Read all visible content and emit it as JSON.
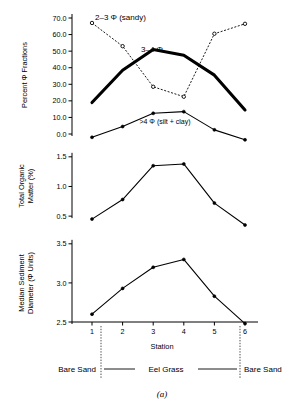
{
  "figure": {
    "caption": "(a)",
    "xaxis_label": "Station",
    "stations": [
      "1",
      "2",
      "3",
      "4",
      "5",
      "6"
    ]
  },
  "zones": {
    "left_label": "Bare Sand",
    "middle_label": "Eel Grass",
    "right_label": "Bare Sand"
  },
  "panels": {
    "top": {
      "ylabel": "Percent Φ Fractions",
      "ticklabels": [
        "0.0",
        "10.0",
        "20.0",
        "30.0",
        "40.0",
        "50.0",
        "60.0",
        "70.0"
      ],
      "series_labels": {
        "sandy": "2–3 Φ (sandy)",
        "mid": "3–4 Φ",
        "fine": ">4 Φ (silt + clay)"
      }
    },
    "middle": {
      "ylabel_line1": "Total Organic",
      "ylabel_line2": "Matter (%)",
      "ticklabels": [
        "0.5",
        "1.0",
        "1.5"
      ]
    },
    "bottom": {
      "ylabel_line1": "Median Sediment",
      "ylabel_line2": "Diameter (Φ Units)",
      "ticklabels": [
        "2.5",
        "3.0",
        "3.5"
      ]
    }
  },
  "chart_data": [
    {
      "type": "line",
      "panel": "top",
      "title": "Percent Phi Fractions by Station",
      "xlabel": "Station",
      "ylabel": "Percent Φ Fractions",
      "x": [
        1,
        2,
        3,
        4,
        5,
        6
      ],
      "ylim": [
        0.0,
        70.0
      ],
      "yticks": [
        0.0,
        10.0,
        20.0,
        30.0,
        40.0,
        50.0,
        60.0,
        70.0
      ],
      "grid": false,
      "legend": "inline-annotations",
      "series": [
        {
          "name": "2–3 Φ (sandy)",
          "style": "dotted-open-markers",
          "values": [
            67.0,
            53.0,
            28.5,
            22.5,
            60.5,
            66.5
          ]
        },
        {
          "name": "3–4 Φ",
          "style": "thick-solid",
          "values": [
            19.0,
            38.5,
            51.0,
            47.5,
            35.5,
            14.5
          ]
        },
        {
          "name": ">4 Φ (silt + clay)",
          "style": "thin-solid-filled-markers",
          "values": [
            -2.0,
            4.5,
            12.5,
            13.5,
            2.5,
            -3.5
          ]
        }
      ]
    },
    {
      "type": "line",
      "panel": "middle",
      "title": "Total Organic Matter by Station",
      "xlabel": "Station",
      "ylabel": "Total Organic Matter (%)",
      "x": [
        1,
        2,
        3,
        4,
        5,
        6
      ],
      "ylim": [
        0.3,
        1.75
      ],
      "yticks": [
        0.5,
        1.0,
        1.5
      ],
      "grid": false,
      "series": [
        {
          "name": "Total Organic Matter",
          "style": "thin-solid-filled-markers",
          "values": [
            0.45,
            0.78,
            1.35,
            1.38,
            0.72,
            0.35
          ]
        }
      ]
    },
    {
      "type": "line",
      "panel": "bottom",
      "title": "Median Sediment Diameter by Station",
      "xlabel": "Station",
      "ylabel": "Median Sediment Diameter (Φ Units)",
      "x": [
        1,
        2,
        3,
        4,
        5,
        6
      ],
      "ylim": [
        2.5,
        3.6
      ],
      "yticks": [
        2.5,
        3.0,
        3.5
      ],
      "grid": false,
      "series": [
        {
          "name": "Median Sediment Diameter",
          "style": "thin-solid-filled-markers",
          "values": [
            2.6,
            2.93,
            3.2,
            3.3,
            2.83,
            2.48
          ]
        }
      ]
    }
  ]
}
